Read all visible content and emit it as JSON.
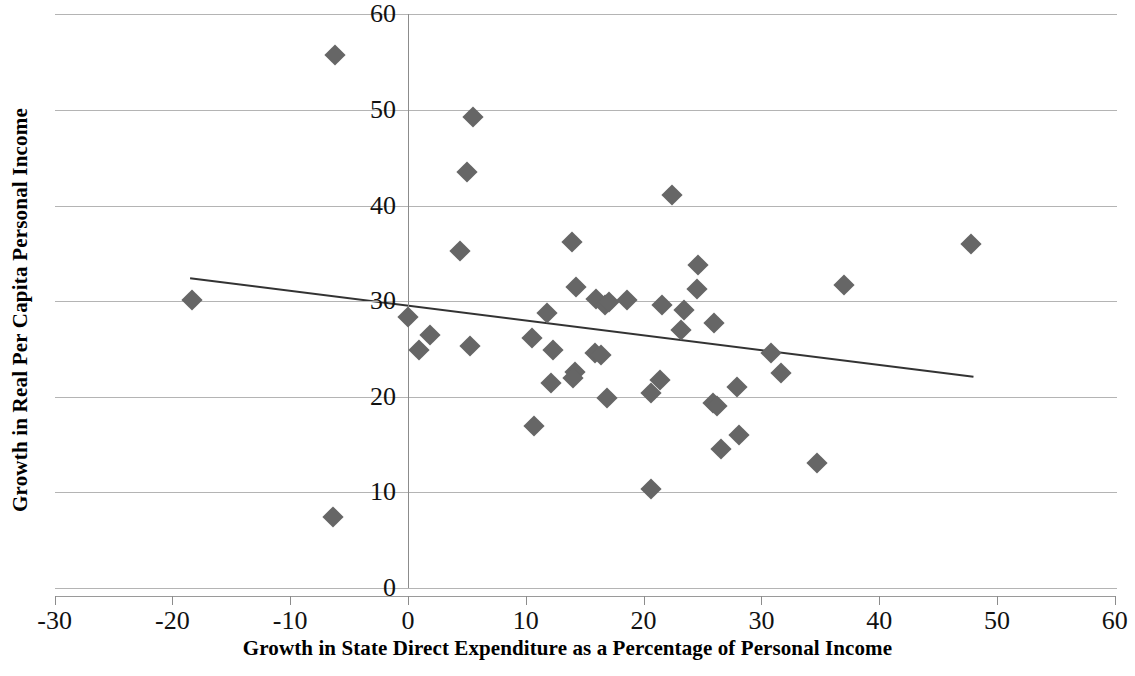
{
  "chart_data": {
    "type": "scatter",
    "title": "",
    "xlabel": "Growth in State Direct Expenditure  as a Percentage of Personal Income",
    "ylabel": "Growth in Real Per Capita Personal Income",
    "xlim": [
      -30,
      60
    ],
    "ylim": [
      0,
      60
    ],
    "xticks": [
      -30,
      -20,
      -10,
      0,
      10,
      20,
      30,
      40,
      50,
      60
    ],
    "yticks": [
      0,
      10,
      20,
      30,
      40,
      50,
      60
    ],
    "xtick_labels": [
      "-30",
      "-20",
      "-10",
      "0",
      "10",
      "20",
      "30",
      "40",
      "50",
      "60"
    ],
    "ytick_labels": [
      "0",
      "10",
      "20",
      "30",
      "40",
      "50",
      "60"
    ],
    "grid": "horizontal",
    "legend": "none",
    "marker": "diamond",
    "marker_color": "#666666",
    "series": [
      {
        "name": "States",
        "points": [
          [
            -18.3,
            30.1
          ],
          [
            -6.2,
            55.8
          ],
          [
            -6.4,
            7.4
          ],
          [
            0.0,
            28.3
          ],
          [
            0.9,
            24.9
          ],
          [
            1.9,
            26.5
          ],
          [
            5.0,
            43.5
          ],
          [
            5.3,
            25.3
          ],
          [
            5.5,
            49.3
          ],
          [
            4.4,
            35.2
          ],
          [
            10.7,
            16.9
          ],
          [
            10.5,
            26.1
          ],
          [
            11.8,
            28.8
          ],
          [
            12.3,
            24.9
          ],
          [
            12.1,
            21.4
          ],
          [
            13.9,
            36.2
          ],
          [
            14.3,
            31.5
          ],
          [
            14.2,
            22.6
          ],
          [
            14.0,
            22.0
          ],
          [
            15.9,
            24.6
          ],
          [
            16.4,
            24.4
          ],
          [
            16.0,
            30.2
          ],
          [
            16.7,
            29.6
          ],
          [
            17.1,
            29.9
          ],
          [
            16.9,
            19.9
          ],
          [
            18.6,
            30.1
          ],
          [
            20.6,
            20.4
          ],
          [
            20.6,
            10.4
          ],
          [
            21.6,
            29.6
          ],
          [
            21.4,
            21.8
          ],
          [
            22.4,
            41.1
          ],
          [
            23.4,
            29.1
          ],
          [
            23.2,
            27.0
          ],
          [
            24.6,
            33.8
          ],
          [
            24.5,
            31.3
          ],
          [
            26.0,
            27.7
          ],
          [
            25.9,
            19.3
          ],
          [
            26.2,
            19.0
          ],
          [
            26.6,
            14.5
          ],
          [
            27.9,
            21.0
          ],
          [
            28.1,
            16.0
          ],
          [
            30.8,
            24.6
          ],
          [
            31.7,
            22.5
          ],
          [
            34.7,
            13.1
          ],
          [
            37.0,
            31.7
          ],
          [
            47.8,
            36.0
          ]
        ]
      }
    ],
    "trendline": {
      "name": "linear-fit",
      "x_start": -18.5,
      "y_start": 32.4,
      "x_end": 48.0,
      "y_end": 22.1,
      "color": "#333333"
    }
  }
}
